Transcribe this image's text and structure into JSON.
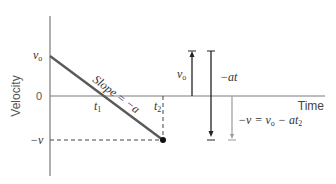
{
  "diagram": {
    "axis": {
      "y_label": "Velocity",
      "x_label": "Time",
      "y_ticks": {
        "v0": "v",
        "v0_sub": "o",
        "zero": "0",
        "neg_v": "−v"
      },
      "x_ticks": {
        "t1": "t",
        "t1_sub": "1",
        "t2": "t",
        "t2_sub": "2"
      }
    },
    "line": {
      "slope_label": "Slope = −a"
    },
    "vectors": {
      "v0_label": "v",
      "v0_sub": "o",
      "at_label": "−at",
      "eq_lhs": "−v = v",
      "eq_sub": "o",
      "eq_mid": " − at",
      "eq_sub2": "2"
    },
    "colors": {
      "axis": "#7a7a7a",
      "line": "#5a5a5a",
      "arrow": "#222222",
      "gray_arrow": "#9a9a9a",
      "text": "#333333"
    }
  }
}
